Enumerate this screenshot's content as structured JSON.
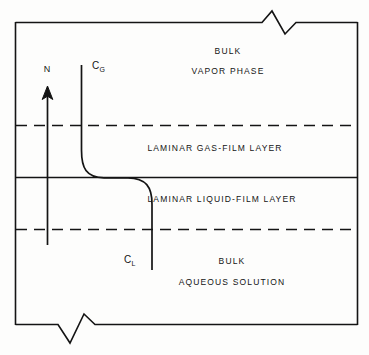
{
  "figure": {
    "type": "two-film-theory-diagram",
    "stroke_color": "#141414",
    "background_color": "#fdfdfc"
  },
  "zones": [
    {
      "id": "bulk-vapor-phase",
      "lines": [
        "BULK",
        "VAPOR  PHASE"
      ],
      "line1": "BULK",
      "line2": "VAPOR  PHASE",
      "center_x": 228,
      "line1_y": 52,
      "line2_y": 72
    },
    {
      "id": "laminar-gas-film-layer",
      "line1": "LAMINAR  GAS-FILM  LAYER",
      "center_x": 215,
      "line1_y": 148
    },
    {
      "id": "laminar-liquid-film-layer",
      "line1": "LAMINAR  LIQUID-FILM  LAYER",
      "center_x": 222,
      "line1_y": 199
    },
    {
      "id": "bulk-aqueous-solution",
      "line1": "BULK",
      "line2": "AQUEOUS  SOLUTION",
      "center_x": 232,
      "line1_y": 262,
      "line2_y": 283
    }
  ],
  "boundaries": {
    "upper_dashed_y": 125,
    "interface_solid_y": 177,
    "lower_dashed_y": 229,
    "box_left": 15,
    "box_right": 358,
    "box_top": 22,
    "box_bottom": 325
  },
  "flux_arrow": {
    "label": "N",
    "label_x": 47,
    "label_y": 64,
    "x": 47,
    "tail_y": 245,
    "head_y": 88
  },
  "concentration_curve": {
    "gas_label": "C",
    "gas_label_sub": "G",
    "gas_label_x": 92,
    "gas_label_y": 60,
    "liquid_label": "C",
    "liquid_label_sub": "L",
    "liquid_label_x": 124,
    "liquid_label_y": 254,
    "gas_line_x": 81,
    "gas_line_top_y": 65,
    "liquid_line_x": 152,
    "liquid_line_bottom_y": 270
  },
  "break_symbols": {
    "top": {
      "start_x": 262,
      "end_x": 308,
      "y": 22
    },
    "bottom": {
      "start_x": 58,
      "end_x": 108,
      "y": 325
    }
  }
}
